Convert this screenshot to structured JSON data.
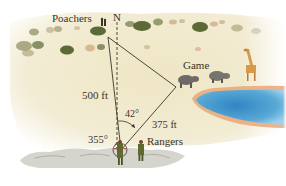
{
  "figure": {
    "labels": {
      "poachers": "Poachers",
      "north": "N",
      "game": "Game",
      "distance_to_poachers": "500 ft",
      "angle_to_game": "42°",
      "distance_to_game": "375 ft",
      "bearing_to_poachers": "355°",
      "rangers": "Rangers"
    },
    "points": {
      "poachers": {
        "x": 108,
        "y": 37
      },
      "game": {
        "x": 176,
        "y": 87
      },
      "rangers": {
        "x": 121,
        "y": 150
      }
    },
    "colors": {
      "ground": "#eee6c9",
      "ground_light": "#f5f0dc",
      "bush": "#6d7a4a",
      "bush_dark": "#4f5a33",
      "water": "#5aa9d6",
      "water_deep": "#2f86c4",
      "shore": "#e9a777",
      "rock": "#c9c9c2",
      "line": "#3c3628",
      "text": "#3a3426",
      "arc_red": "#c23a2a"
    }
  }
}
